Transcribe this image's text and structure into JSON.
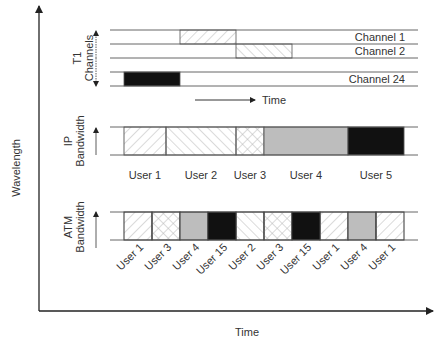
{
  "axes": {
    "y_label": "Wavelength",
    "x_label": "Time"
  },
  "t1": {
    "group_label_line1": "T1",
    "group_label_line2": "Channels",
    "time_label": "Time",
    "channels": [
      {
        "label": "Channel 1",
        "slot": 2,
        "pattern": "hatch-fwd"
      },
      {
        "label": "Channel 2",
        "slot": 3,
        "pattern": "hatch-back"
      },
      {
        "label": "Channel 24",
        "slot": 0,
        "pattern": "black"
      }
    ]
  },
  "ip": {
    "label_line1": "IP",
    "label_line2": "Bandwidth",
    "segments": [
      {
        "user": "User 1",
        "units": 1.5,
        "pattern": "hatch-fwd"
      },
      {
        "user": "User 2",
        "units": 2.5,
        "pattern": "hatch-back"
      },
      {
        "user": "User 3",
        "units": 1,
        "pattern": "cross"
      },
      {
        "user": "User 4",
        "units": 3,
        "pattern": "gray"
      },
      {
        "user": "User 5",
        "units": 2,
        "pattern": "black"
      }
    ]
  },
  "atm": {
    "label_line1": "ATM",
    "label_line2": "Bandwidth",
    "cells": [
      {
        "user": "User 1",
        "pattern": "hatch-fwd"
      },
      {
        "user": "User 3",
        "pattern": "cross"
      },
      {
        "user": "User 4",
        "pattern": "gray"
      },
      {
        "user": "User 15",
        "pattern": "black"
      },
      {
        "user": "User 2",
        "pattern": "hatch-back"
      },
      {
        "user": "User 3",
        "pattern": "cross"
      },
      {
        "user": "User 15",
        "pattern": "black"
      },
      {
        "user": "User 1",
        "pattern": "hatch-fwd"
      },
      {
        "user": "User 4",
        "pattern": "gray"
      },
      {
        "user": "User 1",
        "pattern": "hatch-fwd"
      }
    ]
  },
  "colors": {
    "line": "#555555",
    "axis": "#222222",
    "gray_fill": "#bdbdbd",
    "black_fill": "#111111",
    "hatch": "#b5b5b5"
  }
}
